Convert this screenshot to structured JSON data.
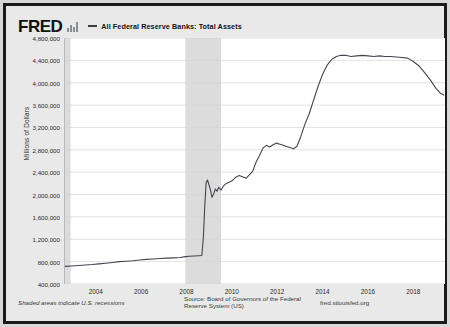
{
  "header": {
    "logo_text": "FRED",
    "logo_icon": "bar-chart-icon",
    "legend_label": "All Federal Reserve Banks: Total Assets"
  },
  "footer": {
    "recession_note": "Shaded areas indicate U.S. recessions",
    "source": "Source: Board of Governors of the Federal Reserve System (US)",
    "url": "fred.stlouisfed.org"
  },
  "colors": {
    "line": "#45454f",
    "recession_band": "#dcdcdc",
    "gridline": "#d5d5d5",
    "plot_background": "#ffffff",
    "page_background": "#e9e9e9",
    "frame": "#1b1b1b"
  },
  "chart_data": {
    "type": "line",
    "title": "All Federal Reserve Banks: Total Assets",
    "xlabel": "",
    "ylabel": "Millions of Dollars",
    "ylim": [
      400000,
      4800000
    ],
    "yticks": [
      400000,
      800000,
      1200000,
      1600000,
      2000000,
      2400000,
      2800000,
      3200000,
      3600000,
      4000000,
      4400000,
      4800000
    ],
    "ytick_labels": [
      "400,000",
      "800,000",
      "1,200,000",
      "1,600,000",
      "2,000,000",
      "2,400,000",
      "2,800,000",
      "3,200,000",
      "3,600,000",
      "4,000,000",
      "4,400,000",
      "4,800,000"
    ],
    "xlim": [
      2002.6,
      2019.4
    ],
    "xticks": [
      2004,
      2006,
      2008,
      2010,
      2012,
      2014,
      2016,
      2018
    ],
    "xtick_labels": [
      "2004",
      "2006",
      "2008",
      "2010",
      "2012",
      "2014",
      "2016",
      "2018"
    ],
    "grid": true,
    "legend_position": "top",
    "recessions": [
      {
        "start": 2002.6,
        "end": 2002.85
      },
      {
        "start": 2007.92,
        "end": 2009.5
      }
    ],
    "series": [
      {
        "name": "All Federal Reserve Banks: Total Assets",
        "x": [
          2002.6,
          2002.9,
          2003.2,
          2003.5,
          2003.8,
          2004.1,
          2004.4,
          2004.7,
          2005.0,
          2005.3,
          2005.6,
          2005.9,
          2006.2,
          2006.5,
          2006.8,
          2007.1,
          2007.4,
          2007.7,
          2007.92,
          2008.1,
          2008.3,
          2008.5,
          2008.65,
          2008.72,
          2008.78,
          2008.84,
          2008.9,
          2008.96,
          2009.02,
          2009.1,
          2009.18,
          2009.25,
          2009.32,
          2009.4,
          2009.5,
          2009.6,
          2009.7,
          2009.8,
          2009.9,
          2010.0,
          2010.15,
          2010.3,
          2010.45,
          2010.6,
          2010.75,
          2010.9,
          2011.05,
          2011.2,
          2011.35,
          2011.5,
          2011.65,
          2011.8,
          2011.95,
          2012.1,
          2012.25,
          2012.4,
          2012.55,
          2012.7,
          2012.85,
          2013.0,
          2013.2,
          2013.4,
          2013.6,
          2013.8,
          2014.0,
          2014.2,
          2014.4,
          2014.6,
          2014.8,
          2015.0,
          2015.25,
          2015.5,
          2015.75,
          2016.0,
          2016.25,
          2016.5,
          2016.75,
          2017.0,
          2017.25,
          2017.5,
          2017.75,
          2018.0,
          2018.25,
          2018.5,
          2018.75,
          2019.0,
          2019.2,
          2019.35
        ],
        "y": [
          715000,
          722000,
          730000,
          740000,
          748000,
          760000,
          772000,
          785000,
          800000,
          808000,
          815000,
          828000,
          840000,
          848000,
          855000,
          862000,
          868000,
          875000,
          890000,
          895000,
          900000,
          905000,
          910000,
          1250000,
          1800000,
          2210000,
          2260000,
          2180000,
          2100000,
          1950000,
          2020000,
          2100000,
          2060000,
          2130000,
          2080000,
          2150000,
          2190000,
          2210000,
          2230000,
          2250000,
          2310000,
          2340000,
          2320000,
          2290000,
          2350000,
          2420000,
          2580000,
          2700000,
          2830000,
          2880000,
          2850000,
          2890000,
          2920000,
          2900000,
          2880000,
          2860000,
          2840000,
          2820000,
          2860000,
          3010000,
          3250000,
          3450000,
          3700000,
          3950000,
          4160000,
          4320000,
          4420000,
          4470000,
          4490000,
          4490000,
          4470000,
          4480000,
          4490000,
          4480000,
          4470000,
          4480000,
          4470000,
          4470000,
          4460000,
          4450000,
          4440000,
          4380000,
          4300000,
          4180000,
          4050000,
          3900000,
          3810000,
          3780000
        ]
      }
    ]
  }
}
